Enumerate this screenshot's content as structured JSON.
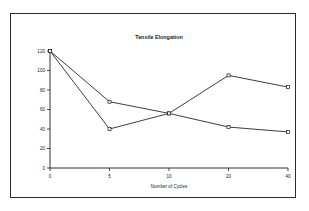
{
  "chart_data": {
    "type": "line",
    "title": "Tensile Elongation",
    "xlabel": "Number of Cycles",
    "ylabel": "",
    "categories": [
      "0",
      "5",
      "10",
      "20",
      "40"
    ],
    "x": [
      0,
      5,
      10,
      20,
      40
    ],
    "xtick_labels": [
      "0",
      "5",
      "10",
      "20",
      "40"
    ],
    "ytick_labels": [
      "0",
      "20",
      "40",
      "60",
      "80",
      "100",
      "120"
    ],
    "yticks": [
      0,
      20,
      40,
      60,
      80,
      100,
      120
    ],
    "ylim": [
      0,
      120
    ],
    "grid": false,
    "legend": "none",
    "marker": "open-square",
    "line_color": "#1a1a1a",
    "series": [
      {
        "name": "Series 1",
        "values": [
          120,
          40,
          56,
          95,
          83
        ]
      },
      {
        "name": "Series 2",
        "values": [
          120,
          68,
          56,
          42,
          37
        ]
      }
    ]
  },
  "figure": {
    "border_color": "#2b2b2b",
    "background": "#ffffff"
  }
}
